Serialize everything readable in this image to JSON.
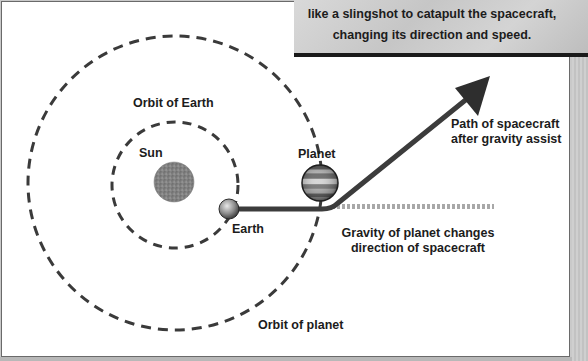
{
  "caption": {
    "lines": [
      "like a slingshot to catapult the spacecraft,",
      "changing its direction and speed."
    ],
    "partial_line_above": "gravity of the planet acts"
  },
  "labels": {
    "orbit_of_earth": "Orbit of Earth",
    "sun": "Sun",
    "planet": "Planet",
    "earth": "Earth",
    "path_line1": "Path of spacecraft",
    "path_line2": "after gravity assist",
    "gravity_line1": "Gravity of planet changes",
    "gravity_line2": "direction of spacecraft",
    "orbit_of_planet": "Orbit of planet"
  },
  "colors": {
    "orbit_dash": "#3a3a3a",
    "path": "#3c3c3c",
    "dotted_original_path": "#a8a8a8",
    "sun": "#8a8a8a",
    "caption_bg": "#cccccc"
  }
}
